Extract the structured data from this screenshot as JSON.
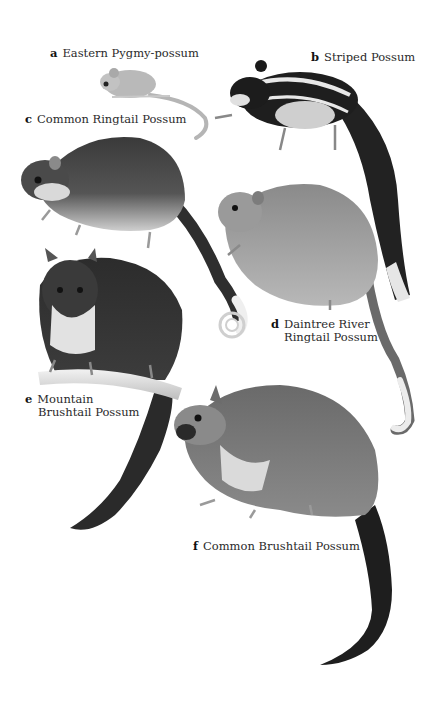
{
  "plate": {
    "background": "#ffffff",
    "specimens": [
      {
        "letter": "a",
        "name": "Eastern Pygmy-possum",
        "name_lines": [
          "Eastern Pygmy-possum"
        ]
      },
      {
        "letter": "b",
        "name": "Striped Possum",
        "name_lines": [
          "Striped Possum"
        ]
      },
      {
        "letter": "c",
        "name": "Common Ringtail Possum",
        "name_lines": [
          "Common Ringtail Possum"
        ]
      },
      {
        "letter": "d",
        "name": "Daintree River Ringtail Possum",
        "name_lines": [
          "Daintree River",
          "Ringtail Possum"
        ]
      },
      {
        "letter": "e",
        "name": "Mountain Brushtail Possum",
        "name_lines": [
          "Mountain",
          "Brushtail Possum"
        ]
      },
      {
        "letter": "f",
        "name": "Common Brushtail Possum",
        "name_lines": [
          "Common Brushtail Possum"
        ]
      }
    ],
    "colors": {
      "text": "#2a2a2a",
      "fur_dark": "#2b2b2b",
      "fur_mid": "#6e6e6e",
      "fur_light": "#a8a8a8",
      "fur_pale": "#dcdcdc"
    }
  }
}
